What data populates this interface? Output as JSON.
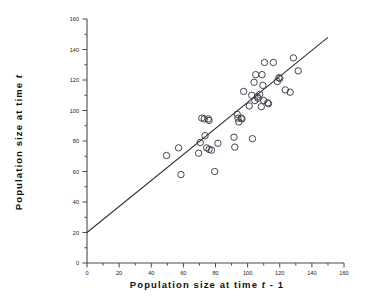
{
  "chart_data": {
    "type": "scatter",
    "title": "",
    "xlabel": "Population size at time t - 1",
    "xlabel_parts": {
      "pre": "Population  size  at  time  ",
      "symbol": "t",
      "post": " - 1"
    },
    "ylabel": "Population size at time t",
    "ylabel_parts": {
      "pre": "Population  size  at  time  ",
      "symbol": "t",
      "post": ""
    },
    "xlim": [
      0,
      160
    ],
    "ylim": [
      0,
      160
    ],
    "xticks": [
      0,
      20,
      40,
      60,
      80,
      100,
      120,
      140,
      160
    ],
    "yticks": [
      0,
      20,
      40,
      60,
      80,
      100,
      120,
      140,
      160
    ],
    "xtick_labels": [
      "0",
      "20",
      "40",
      "60",
      "80",
      "100",
      "120",
      "140",
      "160"
    ],
    "ytick_labels": [
      "0",
      "20",
      "40",
      "60",
      "80",
      "100",
      "120",
      "140",
      "160"
    ],
    "minor_tick_step": 10,
    "grid": false,
    "legend": null,
    "marker": "open-circle",
    "marker_size": 4.4,
    "marker_color": "#3b3b4a",
    "line_color": "#2e2e38",
    "axis_color": "#4a4a52",
    "points": [
      [
        49.5,
        70.5
      ],
      [
        57.0,
        75.5
      ],
      [
        58.5,
        58.0
      ],
      [
        69.5,
        72.0
      ],
      [
        70.5,
        79.0
      ],
      [
        71.5,
        95.0
      ],
      [
        73.0,
        94.5
      ],
      [
        73.5,
        83.5
      ],
      [
        74.5,
        75.5
      ],
      [
        75.5,
        94.5
      ],
      [
        76.0,
        93.5
      ],
      [
        76.0,
        74.5
      ],
      [
        77.5,
        74.0
      ],
      [
        79.5,
        60.0
      ],
      [
        81.5,
        78.5
      ],
      [
        91.5,
        82.5
      ],
      [
        92.0,
        76.0
      ],
      [
        93.5,
        97.5
      ],
      [
        94.0,
        95.0
      ],
      [
        94.5,
        92.5
      ],
      [
        96.0,
        95.0
      ],
      [
        96.5,
        94.5
      ],
      [
        97.5,
        112.5
      ],
      [
        101.0,
        103.0
      ],
      [
        102.5,
        110.0
      ],
      [
        103.0,
        81.5
      ],
      [
        104.0,
        118.5
      ],
      [
        104.5,
        106.5
      ],
      [
        105.0,
        123.5
      ],
      [
        106.0,
        109.0
      ],
      [
        106.5,
        108.0
      ],
      [
        107.5,
        110.5
      ],
      [
        108.5,
        102.5
      ],
      [
        109.0,
        123.5
      ],
      [
        109.5,
        116.5
      ],
      [
        110.0,
        106.5
      ],
      [
        110.5,
        131.5
      ],
      [
        112.5,
        105.0
      ],
      [
        113.0,
        104.5
      ],
      [
        116.0,
        131.5
      ],
      [
        118.5,
        119.0
      ],
      [
        119.5,
        121.5
      ],
      [
        120.0,
        121.0
      ],
      [
        123.5,
        113.5
      ],
      [
        126.5,
        112.0
      ],
      [
        128.5,
        134.5
      ],
      [
        131.5,
        126.0
      ]
    ],
    "reference_line": {
      "label": "identity-trend-line",
      "x1": 0,
      "y1": 20,
      "x2": 150,
      "y2": 148
    }
  }
}
